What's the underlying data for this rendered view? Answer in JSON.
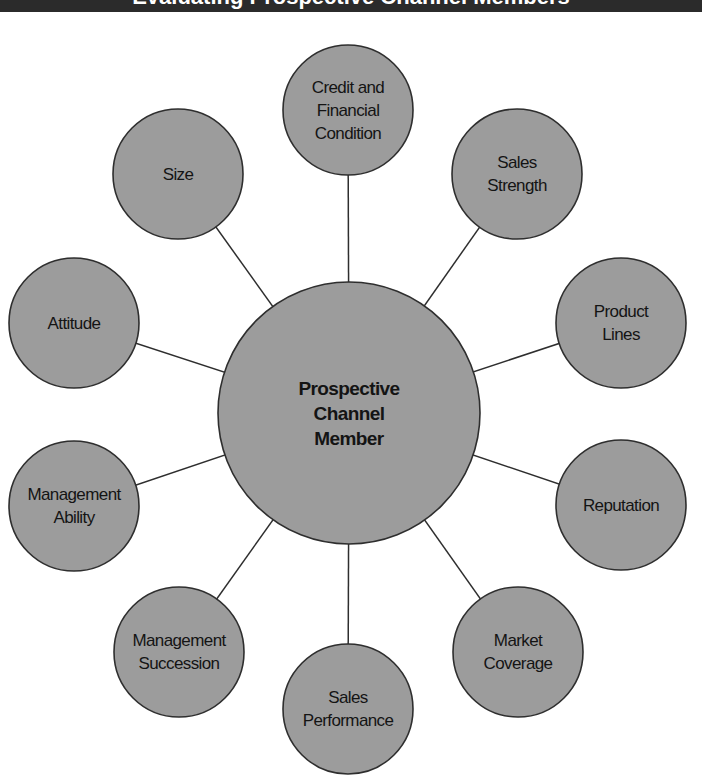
{
  "title_bar": {
    "text": "Evaluating Prospective Channel Members",
    "background": "#2b2b2b"
  },
  "diagram": {
    "type": "hub-and-spoke",
    "colors": {
      "fill": "#9c9c9c",
      "stroke": "#2e2e2e",
      "text": "#141414"
    },
    "center": {
      "label": "Prospective\nChannel\nMember",
      "cx": 349,
      "cy": 413,
      "r": 131
    },
    "nodes": [
      {
        "id": "credit",
        "label": "Credit and\nFinancial\nCondition",
        "cx": 348,
        "cy": 110,
        "r": 65
      },
      {
        "id": "sales-strength",
        "label": "Sales\nStrength",
        "cx": 517,
        "cy": 174,
        "r": 65
      },
      {
        "id": "product-lines",
        "label": "Product\nLines",
        "cx": 621,
        "cy": 323,
        "r": 65
      },
      {
        "id": "reputation",
        "label": "Reputation",
        "cx": 621,
        "cy": 505,
        "r": 65
      },
      {
        "id": "market-coverage",
        "label": "Market\nCoverage",
        "cx": 518,
        "cy": 652,
        "r": 65
      },
      {
        "id": "sales-performance",
        "label": "Sales\nPerformance",
        "cx": 348,
        "cy": 709,
        "r": 65
      },
      {
        "id": "management-succession",
        "label": "Management\nSuccession",
        "cx": 179,
        "cy": 652,
        "r": 65
      },
      {
        "id": "management-ability",
        "label": "Management\nAbility",
        "cx": 74,
        "cy": 506,
        "r": 65
      },
      {
        "id": "attitude",
        "label": "Attitude",
        "cx": 74,
        "cy": 323,
        "r": 65
      },
      {
        "id": "size",
        "label": "Size",
        "cx": 178,
        "cy": 174,
        "r": 65
      }
    ]
  }
}
